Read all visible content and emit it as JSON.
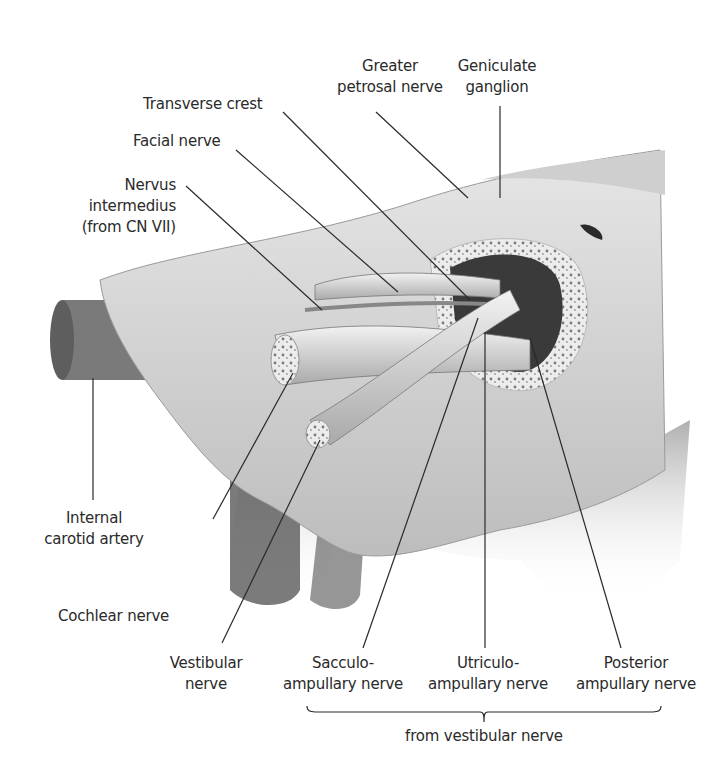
{
  "figure": {
    "labels": {
      "greater_petrosal_nerve": [
        "Greater",
        "petrosal nerve"
      ],
      "geniculate_ganglion": [
        "Geniculate",
        "ganglion"
      ],
      "transverse_crest": "Transverse crest",
      "facial_nerve": "Facial nerve",
      "nervus_intermedius": [
        "Nervus",
        "intermedius",
        "(from CN VII)"
      ],
      "internal_carotid_artery": [
        "Internal",
        "carotid artery"
      ],
      "cochlear_nerve": "Cochlear nerve",
      "vestibular_nerve": [
        "Vestibular",
        "nerve"
      ],
      "sacculo_ampullary_nerve": [
        "Sacculo-",
        "ampullary nerve"
      ],
      "utriculo_ampullary_nerve": [
        "Utriculo-",
        "ampullary nerve"
      ],
      "posterior_ampullary_nerve": [
        "Posterior",
        "ampullary nerve"
      ],
      "group_caption": "from vestibular nerve"
    },
    "colors": {
      "ink": "#2a2a2a",
      "bone": "#d9d9d9",
      "shadow": "#4a4a4a",
      "dark": "#1e1e1e"
    }
  }
}
